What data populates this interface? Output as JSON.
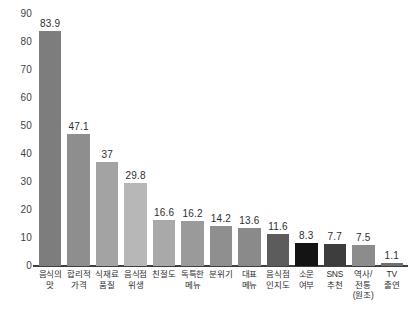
{
  "chart_data": {
    "type": "bar",
    "title": "",
    "subtitle": "",
    "xlabel": "",
    "ylabel": "",
    "ylim": [
      0,
      90
    ],
    "ytick_step": 10,
    "yticks": [
      "90",
      "80",
      "70",
      "60",
      "50",
      "40",
      "30",
      "20",
      "10",
      "0"
    ],
    "grid": false,
    "legend": "none",
    "orientation": "vertical",
    "categories": [
      "음식의\n맛",
      "합리적\n가격",
      "식재료\n품질",
      "음식점\n위생",
      "친절도",
      "독특한\n메뉴",
      "분위기",
      "대표\n메뉴",
      "음식점\n인지도",
      "소문\n여부",
      "SNS\n추천",
      "역사/\n전통\n(원조)",
      "TV\n출연"
    ],
    "values": [
      83.9,
      47.1,
      37,
      29.8,
      16.6,
      16.2,
      14.2,
      13.6,
      11.6,
      8.3,
      7.7,
      7.5,
      1.1
    ],
    "value_labels": [
      "83.9",
      "47.1",
      "37",
      "29.8",
      "16.6",
      "16.2",
      "14.2",
      "13.6",
      "11.6",
      "8.3",
      "7.7",
      "7.5",
      "1.1"
    ],
    "bar_colors": [
      "#7d7d7d",
      "#8e8e8e",
      "#a3a3a3",
      "#b7b7b7",
      "#a9a9a9",
      "#9a9a9a",
      "#8f8f8f",
      "#8a8a8a",
      "#5c5c5c",
      "#141414",
      "#3d3d3d",
      "#8c8c8c",
      "#6f6f6f"
    ],
    "axis_color": "#3f3f3f",
    "background_color": "#ffffff"
  }
}
